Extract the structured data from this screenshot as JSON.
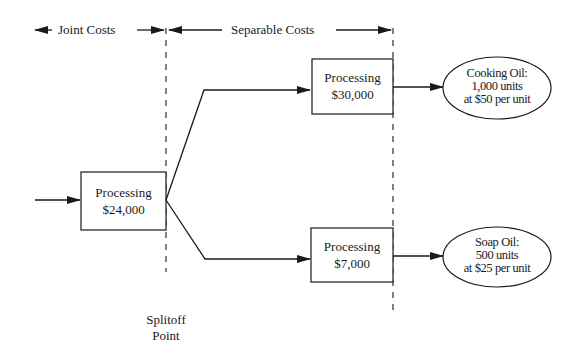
{
  "header": {
    "joint_costs_label": "Joint Costs",
    "separable_costs_label": "Separable Costs"
  },
  "nodes": {
    "joint_processing": {
      "title": "Processing",
      "cost": "$24,000"
    },
    "cooking_processing": {
      "title": "Processing",
      "cost": "$30,000"
    },
    "soap_processing": {
      "title": "Processing",
      "cost": "$7,000"
    }
  },
  "products": [
    {
      "line1": "Cooking Oil:",
      "line2": "1,000 units",
      "line3": "at $50 per unit"
    },
    {
      "line1": "Soap Oil:",
      "line2": "500 units",
      "line3": "at $25 per unit"
    }
  ],
  "splitoff": {
    "line1": "Splitoff",
    "line2": "Point"
  },
  "colors": {
    "stroke": "#1a1a1a",
    "background": "#ffffff"
  }
}
